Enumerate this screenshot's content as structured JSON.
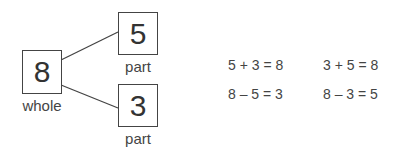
{
  "diagram": {
    "whole": {
      "value": "8",
      "label": "whole"
    },
    "parts": [
      {
        "value": "5",
        "label": "part"
      },
      {
        "value": "3",
        "label": "part"
      }
    ]
  },
  "equations": [
    "5 + 3 = 8",
    "3 + 5 = 8",
    "8 – 5 = 3",
    "8 – 3 = 5"
  ]
}
